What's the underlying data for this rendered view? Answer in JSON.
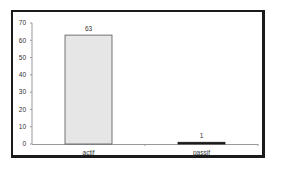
{
  "chart_data": {
    "type": "bar",
    "title": "",
    "xlabel": "",
    "ylabel": "",
    "categories": [
      "actif",
      "passif"
    ],
    "values": [
      63,
      1
    ],
    "data_labels": [
      "63",
      "1"
    ],
    "ylim": [
      0,
      70
    ],
    "yticks": [
      0,
      10,
      20,
      30,
      40,
      50,
      60,
      70
    ],
    "ytick_labels": [
      "0",
      "10",
      "20",
      "30",
      "40",
      "50",
      "60",
      "70"
    ],
    "grid": false,
    "legend": null,
    "colors": {
      "bar_fill": "#e6e6e6",
      "bar_stroke": "#555555",
      "frame": "#1a1a1a",
      "axis": "#999999"
    }
  }
}
